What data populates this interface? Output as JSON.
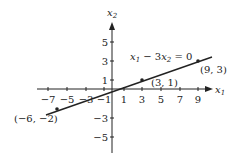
{
  "figure": {
    "type": "coordinate-plane-line",
    "axes": {
      "x_label": "x",
      "x_sub": "1",
      "y_label": "x",
      "y_sub": "2",
      "x_ticks": [
        "−7",
        "−5",
        "−3",
        "−1",
        "1",
        "3",
        "5",
        "7",
        "9"
      ],
      "y_ticks": [
        "5",
        "3",
        "1",
        "−3",
        "−5"
      ]
    },
    "line": {
      "equation_parts": [
        "x",
        "1",
        " − 3",
        "x",
        "2",
        " = 0"
      ],
      "equation_text": "x1 − 3x2 = 0"
    },
    "points": [
      {
        "label": "(−6, −2)",
        "x": -6,
        "y": -2
      },
      {
        "label": "(3, 1)",
        "x": 3,
        "y": 1
      },
      {
        "label": "(9, 3)",
        "x": 9,
        "y": 3
      }
    ],
    "colors": {
      "ink": "#222222",
      "background": "#ffffff"
    }
  }
}
